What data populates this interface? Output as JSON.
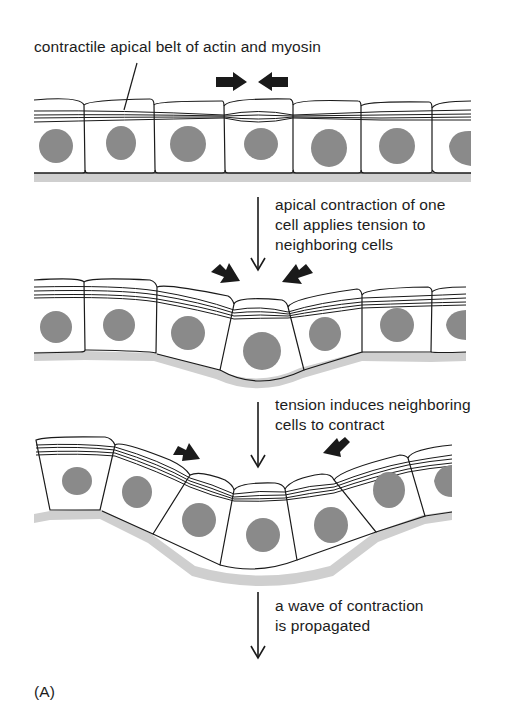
{
  "figure": {
    "panel_label": "(A)",
    "annotation_top": "contractile apical belt of actin and myosin",
    "stages": [
      {
        "id": "stage-1",
        "description": "flat epithelium with apical belt",
        "cell_count": 7,
        "force_arrows": 2
      },
      {
        "id": "stage-2",
        "description": "one cell apically contracts",
        "cell_count": 7,
        "force_arrows": 2
      },
      {
        "id": "stage-3",
        "description": "neighboring cells contract, sheet bends",
        "cell_count": 7,
        "force_arrows": 2
      }
    ],
    "steps": [
      {
        "lines": [
          "apical contraction of one",
          "cell applies tension to",
          "neighboring cells"
        ]
      },
      {
        "lines": [
          "tension induces neighboring",
          "cells to contract"
        ]
      },
      {
        "lines": [
          "a wave of contraction",
          "is propagated"
        ]
      }
    ]
  },
  "colors": {
    "line": "#1a1a1a",
    "nucleus": "#8a8a8a",
    "basal_lamina": "#cfcfcf",
    "background": "#ffffff"
  }
}
